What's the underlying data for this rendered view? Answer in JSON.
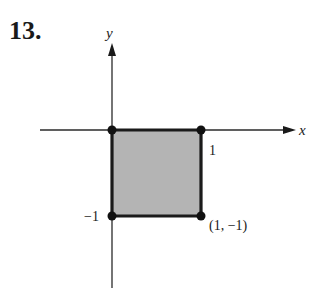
{
  "problem": {
    "number": "13."
  },
  "axes": {
    "x_label": "x",
    "y_label": "y"
  },
  "labels": {
    "x_tick": "1",
    "y_tick": "−1",
    "corner_point": "(1, −1)"
  },
  "region": {
    "description": "Shaded square with vertices (0,0), (1,0), (1,-1), (0,-1)",
    "fill_color": "#b4b4b4",
    "edge_color": "#1a1a1a"
  },
  "vertices": [
    {
      "x": 0,
      "y": 0
    },
    {
      "x": 1,
      "y": 0
    },
    {
      "x": 0,
      "y": -1
    },
    {
      "x": 1,
      "y": -1
    }
  ]
}
